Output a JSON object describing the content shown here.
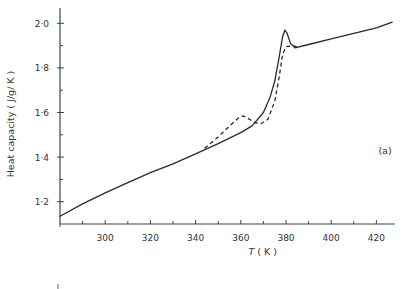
{
  "chart_data": {
    "type": "line",
    "title": "",
    "xlabel": "T (K)",
    "xlabel_italic_part": "T",
    "xlabel_unit": "( K )",
    "ylabel": "Heat capacity (J/g/K)",
    "xlim": [
      280,
      428
    ],
    "ylim": [
      1.1,
      2.08
    ],
    "x_ticks": [
      300,
      320,
      340,
      360,
      380,
      400,
      420
    ],
    "x_minor_ticks": [
      290,
      310,
      330,
      350,
      370,
      390,
      410
    ],
    "y_ticks": [
      1.2,
      1.4,
      1.6,
      1.8,
      2.0
    ],
    "y_tick_labels": [
      "1·2",
      "1·4",
      "1·6",
      "1·8",
      "2·0"
    ],
    "y_minor_ticks": [
      1.3,
      1.5,
      1.7,
      1.9
    ],
    "grid": false,
    "legend": null,
    "annotations": [
      {
        "text": "(a)",
        "x": 418,
        "y": 1.46
      }
    ],
    "series": [
      {
        "name": "solid",
        "style": "solid",
        "points": [
          [
            280,
            1.135
          ],
          [
            290,
            1.19
          ],
          [
            300,
            1.24
          ],
          [
            310,
            1.285
          ],
          [
            320,
            1.33
          ],
          [
            330,
            1.37
          ],
          [
            340,
            1.415
          ],
          [
            350,
            1.46
          ],
          [
            360,
            1.51
          ],
          [
            365,
            1.54
          ],
          [
            370,
            1.6
          ],
          [
            373,
            1.67
          ],
          [
            375,
            1.74
          ],
          [
            377,
            1.85
          ],
          [
            378.5,
            1.94
          ],
          [
            379.5,
            1.97
          ],
          [
            380.5,
            1.955
          ],
          [
            382,
            1.91
          ],
          [
            384,
            1.89
          ],
          [
            390,
            1.905
          ],
          [
            400,
            1.93
          ],
          [
            410,
            1.955
          ],
          [
            420,
            1.98
          ],
          [
            427,
            2.005
          ]
        ]
      },
      {
        "name": "dashed",
        "style": "dashed",
        "points": [
          [
            344,
            1.44
          ],
          [
            350,
            1.49
          ],
          [
            355,
            1.54
          ],
          [
            359,
            1.575
          ],
          [
            361,
            1.585
          ],
          [
            363,
            1.575
          ],
          [
            366,
            1.555
          ],
          [
            369,
            1.55
          ],
          [
            372,
            1.57
          ],
          [
            375,
            1.65
          ],
          [
            377,
            1.76
          ],
          [
            378.5,
            1.86
          ],
          [
            380,
            1.895
          ],
          [
            383,
            1.9
          ],
          [
            386,
            1.89
          ]
        ]
      }
    ]
  }
}
